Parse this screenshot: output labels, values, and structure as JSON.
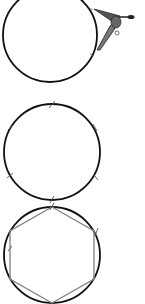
{
  "diagram": {
    "type": "geometric-construction",
    "steps": [
      {
        "step": 1,
        "description": "Circle drawn with compass; compass marking arc on circle",
        "circle": {
          "cx": 50,
          "cy": 35,
          "r": 47
        }
      },
      {
        "step": 2,
        "description": "Circle with six radius-length tick marks around circumference",
        "circle": {
          "cx": 52,
          "cy": 152,
          "r": 48
        },
        "tick_count": 6
      },
      {
        "step": 3,
        "description": "Tick marks joined to form inscribed hexagon",
        "circle": {
          "cx": 52,
          "cy": 255,
          "r": 48
        },
        "polygon_sides": 6
      }
    ],
    "colors": {
      "circle": "#111111",
      "hexagon": "#888888",
      "tick": "#555555",
      "compass": "#333333"
    }
  }
}
